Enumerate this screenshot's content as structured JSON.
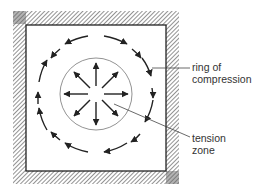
{
  "diagram": {
    "type": "stress-field",
    "labels": {
      "ring_line1": "ring of",
      "ring_line2": "compression",
      "tension_line1": "tension",
      "tension_line2": "zone"
    },
    "colors": {
      "line": "#222222",
      "hatch": "#888888",
      "background": "#ffffff"
    },
    "tension_arrows": 8,
    "compression_arrows": 16
  }
}
